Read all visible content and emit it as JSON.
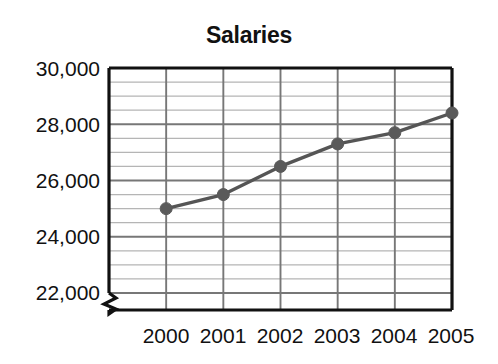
{
  "chart_data": {
    "type": "line",
    "title": "Salaries",
    "xlabel": "",
    "ylabel": "",
    "categories": [
      "2000",
      "2001",
      "2002",
      "2003",
      "2004",
      "2005"
    ],
    "x": [
      2000,
      2001,
      2002,
      2003,
      2004,
      2005
    ],
    "series": [
      {
        "name": "Salaries",
        "values": [
          25000,
          25500,
          26500,
          27300,
          27700,
          28400
        ]
      }
    ],
    "ylim": [
      22000,
      30000
    ],
    "ytick_labels": [
      "22,000",
      "24,000",
      "26,000",
      "28,000",
      "30,000"
    ],
    "ytick_values": [
      22000,
      24000,
      26000,
      28000,
      30000
    ],
    "yminor_step": 500,
    "grid": true,
    "legend": "none",
    "axis_break": true,
    "axis_break_note": "zigzag break on y-axis below 22,000",
    "marker": "circle",
    "colors": {
      "line": "#555555",
      "marker": "#5a5a5a",
      "axis": "#111111",
      "grid_major": "#777777",
      "grid_minor": "#b5b5b5",
      "background": "#ffffff",
      "text": "#111111"
    }
  },
  "axes": {
    "y_ticks": [
      {
        "label": "30,000",
        "value": 30000
      },
      {
        "label": "28,000",
        "value": 28000
      },
      {
        "label": "26,000",
        "value": 26000
      },
      {
        "label": "24,000",
        "value": 24000
      },
      {
        "label": "22,000",
        "value": 22000
      }
    ],
    "x_ticks": [
      {
        "label": "2000"
      },
      {
        "label": "2001"
      },
      {
        "label": "2002"
      },
      {
        "label": "2003"
      },
      {
        "label": "2004"
      },
      {
        "label": "2005"
      }
    ]
  }
}
